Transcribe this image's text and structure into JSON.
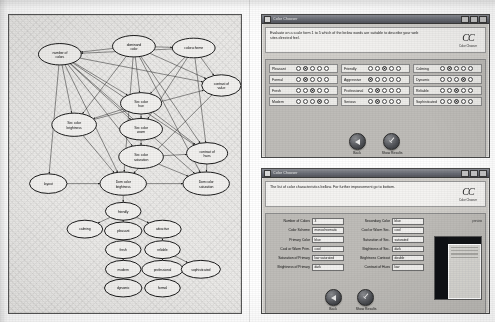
{
  "figure": {
    "caption": "",
    "panels": [
      "bayesian-network-diagram",
      "survey-window",
      "results-window"
    ]
  },
  "diagram": {
    "title": "",
    "nodes": [
      {
        "id": "number_of_colors",
        "label": "number of\ncolors",
        "line1": "number of",
        "line2": "colors",
        "x": 57,
        "y": 37,
        "rx": 24,
        "ry": 12
      },
      {
        "id": "dominant_color",
        "label": "dominand color",
        "line1": "dominand",
        "line2": "color",
        "x": 140,
        "y": 28,
        "rx": 24,
        "ry": 12
      },
      {
        "id": "colorscheme",
        "label": "colorscheme",
        "line1": "colorscheme",
        "line2": "",
        "x": 207,
        "y": 30,
        "rx": 24,
        "ry": 11
      },
      {
        "id": "contrast_of_value",
        "label": "contrast of value",
        "line1": "contrast of",
        "line2": "value",
        "x": 238,
        "y": 72,
        "rx": 22,
        "ry": 12
      },
      {
        "id": "sec_color_hue",
        "label": "Sec color hue",
        "line1": "Sec color",
        "line2": "hue",
        "x": 148,
        "y": 92,
        "rx": 23,
        "ry": 12
      },
      {
        "id": "sec_color_brightness",
        "label": "Sec color brightness",
        "line1": "Sec color",
        "line2": "brightness",
        "x": 73,
        "y": 116,
        "rx": 25,
        "ry": 13
      },
      {
        "id": "sec_color_warm",
        "label": "Sec color warm",
        "line1": "Sec color",
        "line2": "warm",
        "x": 148,
        "y": 121,
        "rx": 24,
        "ry": 12
      },
      {
        "id": "sec_color_saturation",
        "label": "Sec color saturation",
        "line1": "Sec color",
        "line2": "saturation",
        "x": 148,
        "y": 152,
        "rx": 25,
        "ry": 13
      },
      {
        "id": "contrast_of_hues",
        "label": "contrast of hues",
        "line1": "contrast of",
        "line2": "hues",
        "x": 222,
        "y": 148,
        "rx": 23,
        "ry": 12
      },
      {
        "id": "layout",
        "label": "layout",
        "line1": "layout",
        "line2": "",
        "x": 44,
        "y": 182,
        "rx": 21,
        "ry": 11
      },
      {
        "id": "dom_color_brightness",
        "label": "Dom color brightness",
        "line1": "Dom color",
        "line2": "brightness",
        "x": 128,
        "y": 182,
        "rx": 26,
        "ry": 13
      },
      {
        "id": "dom_color_saturation",
        "label": "Dom color saturation",
        "line1": "Dom color",
        "line2": "saturation",
        "x": 221,
        "y": 182,
        "rx": 26,
        "ry": 13
      },
      {
        "id": "friendly",
        "label": "friendly",
        "line1": "friendly",
        "line2": "",
        "x": 128,
        "y": 213,
        "rx": 20,
        "ry": 10
      },
      {
        "id": "calming",
        "label": "calming",
        "line1": "calming",
        "line2": "",
        "x": 85,
        "y": 233,
        "rx": 20,
        "ry": 10
      },
      {
        "id": "pleasant",
        "label": "pleasant",
        "line1": "pleasant",
        "line2": "",
        "x": 128,
        "y": 235,
        "rx": 21,
        "ry": 10
      },
      {
        "id": "attractive",
        "label": "attractive",
        "line1": "attractive",
        "line2": "",
        "x": 172,
        "y": 233,
        "rx": 21,
        "ry": 10
      },
      {
        "id": "fresh",
        "label": "fresh",
        "line1": "fresh",
        "line2": "",
        "x": 128,
        "y": 256,
        "rx": 20,
        "ry": 10
      },
      {
        "id": "reliable",
        "label": "reliable",
        "line1": "reliable",
        "line2": "",
        "x": 172,
        "y": 256,
        "rx": 20,
        "ry": 10
      },
      {
        "id": "modern",
        "label": "modern",
        "line1": "modern",
        "line2": "",
        "x": 128,
        "y": 278,
        "rx": 20,
        "ry": 10
      },
      {
        "id": "professional",
        "label": "professional",
        "line1": "professional",
        "line2": "",
        "x": 172,
        "y": 278,
        "rx": 23,
        "ry": 10
      },
      {
        "id": "sophisticated",
        "label": "sophisticated",
        "line1": "sophisticated",
        "line2": "",
        "x": 215,
        "y": 278,
        "rx": 22,
        "ry": 10
      },
      {
        "id": "dynamic",
        "label": "dynamic",
        "line1": "dynamic",
        "line2": "",
        "x": 128,
        "y": 299,
        "rx": 21,
        "ry": 10
      },
      {
        "id": "formal",
        "label": "formal",
        "line1": "formal",
        "line2": "",
        "x": 172,
        "y": 299,
        "rx": 20,
        "ry": 10
      }
    ],
    "edges": [
      [
        "dominant_color",
        "number_of_colors"
      ],
      [
        "colorscheme",
        "number_of_colors"
      ],
      [
        "dominant_color",
        "colorscheme"
      ],
      [
        "dominant_color",
        "sec_color_hue"
      ],
      [
        "colorscheme",
        "sec_color_hue"
      ],
      [
        "number_of_colors",
        "sec_color_hue"
      ],
      [
        "number_of_colors",
        "sec_color_brightness"
      ],
      [
        "number_of_colors",
        "sec_color_warm"
      ],
      [
        "number_of_colors",
        "sec_color_saturation"
      ],
      [
        "number_of_colors",
        "contrast_of_value"
      ],
      [
        "number_of_colors",
        "contrast_of_hues"
      ],
      [
        "number_of_colors",
        "layout"
      ],
      [
        "number_of_colors",
        "dom_color_brightness"
      ],
      [
        "number_of_colors",
        "dom_color_saturation"
      ],
      [
        "dominant_color",
        "contrast_of_value"
      ],
      [
        "dominant_color",
        "contrast_of_hues"
      ],
      [
        "dominant_color",
        "dom_color_brightness"
      ],
      [
        "dominant_color",
        "dom_color_saturation"
      ],
      [
        "dominant_color",
        "sec_color_brightness"
      ],
      [
        "colorscheme",
        "contrast_of_value"
      ],
      [
        "colorscheme",
        "contrast_of_hues"
      ],
      [
        "colorscheme",
        "sec_color_warm"
      ],
      [
        "sec_color_hue",
        "sec_color_warm"
      ],
      [
        "sec_color_hue",
        "contrast_of_hues"
      ],
      [
        "sec_color_hue",
        "sec_color_brightness"
      ],
      [
        "sec_color_warm",
        "sec_color_saturation"
      ],
      [
        "sec_color_brightness",
        "contrast_of_value"
      ],
      [
        "sec_color_brightness",
        "dom_color_brightness"
      ],
      [
        "sec_color_saturation",
        "dom_color_saturation"
      ],
      [
        "sec_color_saturation",
        "contrast_of_hues"
      ],
      [
        "contrast_of_value",
        "dom_color_brightness"
      ],
      [
        "contrast_of_hues",
        "dom_color_saturation"
      ],
      [
        "layout",
        "dom_color_brightness"
      ],
      [
        "dom_color_brightness",
        "dom_color_saturation"
      ],
      [
        "dom_color_brightness",
        "friendly"
      ],
      [
        "friendly",
        "calming"
      ],
      [
        "friendly",
        "pleasant"
      ],
      [
        "friendly",
        "attractive"
      ],
      [
        "pleasant",
        "fresh"
      ],
      [
        "fresh",
        "modern"
      ],
      [
        "modern",
        "dynamic"
      ],
      [
        "attractive",
        "reliable"
      ],
      [
        "reliable",
        "professional"
      ],
      [
        "reliable",
        "sophisticated"
      ],
      [
        "professional",
        "formal"
      ]
    ]
  },
  "survey_window": {
    "titlebar": {
      "title": "Color Chooser",
      "icon": "app-icon",
      "buttons": [
        "minimize",
        "maximize",
        "close"
      ]
    },
    "instruction": "Evaluate on a scale form 1 to 5 which of the below words are suitable to describe your web sites directed feel.",
    "logo": {
      "mark": "CC",
      "subtitle": "Color Chooser"
    },
    "scale": {
      "min": 1,
      "max": 5,
      "steps": 5
    },
    "words": [
      {
        "label": "Pleasant",
        "selected": 2
      },
      {
        "label": "Friendly",
        "selected": 3
      },
      {
        "label": "Calming",
        "selected": 2
      },
      {
        "label": "Formal",
        "selected": 2
      },
      {
        "label": "Aggressive",
        "selected": 1
      },
      {
        "label": "Dynamic",
        "selected": 4
      },
      {
        "label": "Fresh",
        "selected": 3
      },
      {
        "label": "Professional",
        "selected": 2
      },
      {
        "label": "Reliable",
        "selected": 3
      },
      {
        "label": "Modern",
        "selected": 4
      },
      {
        "label": "Serious",
        "selected": 2
      },
      {
        "label": "Sophisticated",
        "selected": 3
      }
    ],
    "buttons": [
      {
        "label": "Back",
        "icon": "triangle-left-icon"
      },
      {
        "label": "Show Results",
        "icon": "check-icon"
      }
    ]
  },
  "results_window": {
    "titlebar": {
      "title": "Color Chooser",
      "icon": "app-icon",
      "buttons": [
        "minimize",
        "maximize",
        "close"
      ]
    },
    "instruction": "The list of color characteristics bellow. For further improvement go to bottom.",
    "logo": {
      "mark": "CC",
      "subtitle": "Color Chooser"
    },
    "corner_tag": "preview",
    "fields_left": [
      {
        "label": "Number of Colors",
        "value": "3"
      },
      {
        "label": "Color Scheme",
        "value": "monochromatic"
      },
      {
        "label": "Primary Color",
        "value": "blue"
      },
      {
        "label": "Cool or Warm Prim.",
        "value": "cool"
      },
      {
        "label": "Saturation of Primary",
        "value": "low saturated"
      },
      {
        "label": "Brightness of Primary",
        "value": "dark"
      }
    ],
    "fields_right": [
      {
        "label": "Secondary Color",
        "value": "blue"
      },
      {
        "label": "Cool or Warm Sec.",
        "value": "cool"
      },
      {
        "label": "Saturation of Sec.",
        "value": "saturated"
      },
      {
        "label": "Brightness of Sec.",
        "value": "dark"
      },
      {
        "label": "Brightness Contrast",
        "value": "double"
      },
      {
        "label": "Contrast of Hues",
        "value": "low"
      }
    ],
    "buttons": [
      {
        "label": "Back",
        "icon": "triangle-left-icon"
      },
      {
        "label": "Show Results",
        "icon": "check-icon"
      }
    ]
  },
  "colors": {
    "paper": "#fdfdfd",
    "panel_bg": "#e9e8e6",
    "window_chrome": "#cfcdc9",
    "field_bg": "#efeeec",
    "ink": "#111111"
  }
}
